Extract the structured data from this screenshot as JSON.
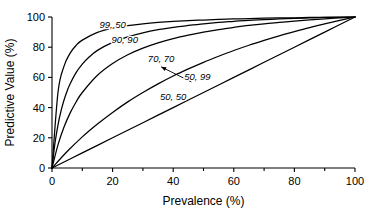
{
  "chart_data": {
    "type": "line",
    "title": "",
    "xlabel": "Prevalence (%)",
    "ylabel": "Predictive Value (%)",
    "xlim": [
      0,
      100
    ],
    "ylim": [
      0,
      100
    ],
    "xticks": [
      0,
      20,
      40,
      60,
      80,
      100
    ],
    "yticks": [
      0,
      20,
      40,
      60,
      80,
      100
    ],
    "xtick_labels": [
      "0",
      "20",
      "40",
      "60",
      "80",
      "100"
    ],
    "ytick_labels": [
      "0",
      "20",
      "40",
      "60",
      "80",
      "100"
    ],
    "xminor_ticks": [
      10,
      30,
      50,
      70,
      90
    ],
    "grid": false,
    "legend_position": "inline-annotations",
    "series": [
      {
        "name": "99, 50",
        "sensitivity": 99,
        "specificity": 50,
        "label": "99, 50",
        "label_x": 20,
        "label_y": 93,
        "x": [
          0,
          1,
          2,
          3,
          4,
          5,
          6,
          8,
          10,
          12,
          15,
          20,
          25,
          30,
          35,
          40,
          45,
          50,
          55,
          60,
          65,
          70,
          75,
          80,
          85,
          90,
          95,
          100
        ],
        "y": [
          0,
          16.7,
          28.8,
          38.0,
          45.2,
          51.0,
          55.8,
          63.3,
          68.8,
          73.0,
          77.9,
          83.2,
          86.8,
          89.5,
          91.6,
          93.2,
          94.4,
          95.5,
          96.4,
          97.1,
          97.8,
          98.2,
          98.7,
          99.1,
          99.4,
          99.7,
          99.8,
          100
        ]
      },
      {
        "name": "90, 90",
        "sensitivity": 90,
        "specificity": 90,
        "label": "90, 90",
        "label_x": 24,
        "label_y": 83,
        "x": [
          0,
          2,
          4,
          6,
          8,
          10,
          15,
          20,
          25,
          30,
          35,
          40,
          45,
          50,
          55,
          60,
          65,
          70,
          75,
          80,
          85,
          90,
          95,
          100
        ],
        "y": [
          0,
          15.5,
          27.3,
          36.5,
          43.9,
          50.0,
          61.4,
          69.2,
          75.0,
          79.4,
          82.9,
          85.7,
          88.0,
          90.0,
          91.7,
          93.1,
          94.4,
          95.5,
          96.4,
          97.3,
          98.1,
          98.8,
          99.4,
          100
        ]
      },
      {
        "name": "70, 70",
        "sensitivity": 70,
        "specificity": 70,
        "label": "70, 70",
        "label_x": 36,
        "label_y": 70,
        "x": [
          0,
          5,
          10,
          15,
          20,
          25,
          30,
          35,
          40,
          45,
          50,
          55,
          60,
          65,
          70,
          75,
          80,
          85,
          90,
          95,
          100
        ],
        "y": [
          0,
          10.9,
          20.6,
          29.1,
          36.8,
          43.8,
          50.0,
          55.7,
          60.9,
          65.6,
          70.0,
          74.0,
          77.8,
          81.3,
          84.5,
          87.5,
          90.3,
          93.0,
          95.5,
          97.8,
          100
        ]
      },
      {
        "name": "50, 99",
        "sensitivity": 50,
        "specificity": 99,
        "label": "50, 99",
        "label_x": 48,
        "label_y": 58,
        "x": [
          0,
          2,
          4,
          6,
          8,
          10,
          15,
          20,
          25,
          30,
          35,
          40,
          45,
          50,
          55,
          60,
          65,
          70,
          75,
          80,
          85,
          90,
          95,
          100
        ],
        "y": [
          0,
          50.5,
          67.6,
          76.1,
          81.3,
          84.7,
          89.8,
          92.6,
          94.3,
          95.5,
          96.4,
          97.1,
          97.6,
          98.0,
          98.4,
          98.7,
          98.9,
          99.2,
          99.4,
          99.5,
          99.7,
          99.8,
          99.9,
          100
        ]
      },
      {
        "name": "50, 50",
        "sensitivity": 50,
        "specificity": 50,
        "label": "50, 50",
        "label_x": 40,
        "label_y": 45,
        "x": [
          0,
          10,
          20,
          30,
          40,
          50,
          60,
          70,
          80,
          90,
          100
        ],
        "y": [
          0,
          10,
          20,
          30,
          40,
          50,
          60,
          70,
          80,
          90,
          100
        ]
      }
    ],
    "annotations": [
      {
        "name": "arrow-to-50-99-curve",
        "text": "50, 99",
        "points_from_x": 46,
        "points_from_y": 57,
        "points_to_x": 36,
        "points_to_y": 67
      }
    ]
  }
}
